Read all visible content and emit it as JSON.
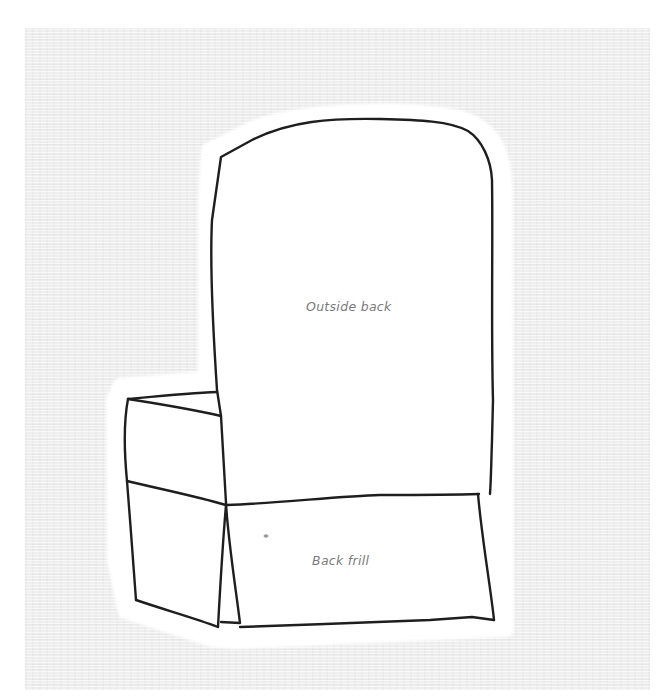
{
  "illustration": {
    "subject": "slipcovered armchair viewed from the back",
    "labels": {
      "outside_back": "Outside back",
      "back_frill": "Back frill"
    },
    "colors": {
      "background": "#ffffff",
      "texture": "#efefef",
      "line": "#1e1e1e",
      "label": "#7a7a7a",
      "cutout": "#ffffff"
    }
  }
}
